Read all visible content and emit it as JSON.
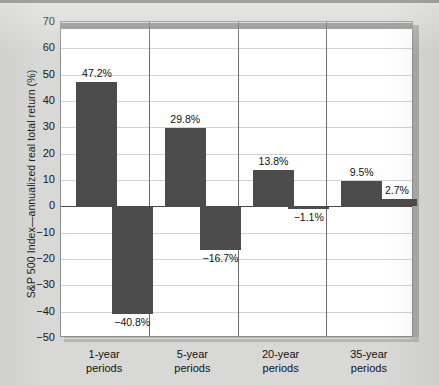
{
  "chart_data": {
    "type": "bar",
    "title": "",
    "xlabel": "",
    "ylabel": "S&P 500 Index—annualized real total return (%)",
    "ylim": [
      -50,
      70
    ],
    "ytick_values": [
      70,
      60,
      50,
      40,
      30,
      20,
      10,
      0,
      -10,
      -20,
      -30,
      -40,
      -50
    ],
    "ytick_labels": [
      "70",
      "60",
      "50",
      "40",
      "30",
      "20",
      "10",
      "0",
      "−10",
      "−20",
      "−30",
      "−40",
      "−50"
    ],
    "grid": true,
    "legend": "none",
    "categories": [
      "1-year periods",
      "5-year periods",
      "20-year periods",
      "35-year periods"
    ],
    "series": [
      {
        "name": "best",
        "values": [
          47.2,
          29.8,
          13.8,
          9.5
        ]
      },
      {
        "name": "worst",
        "values": [
          -40.8,
          -16.7,
          -1.1,
          2.7
        ]
      }
    ],
    "bars": [
      {
        "panel": 0,
        "slot": 0,
        "value": 47.2,
        "label": "47.2%"
      },
      {
        "panel": 0,
        "slot": 1,
        "value": -40.8,
        "label": "−40.8%"
      },
      {
        "panel": 1,
        "slot": 0,
        "value": 29.8,
        "label": "29.8%"
      },
      {
        "panel": 1,
        "slot": 1,
        "value": -16.7,
        "label": "−16.7%"
      },
      {
        "panel": 2,
        "slot": 0,
        "value": 13.8,
        "label": "13.8%"
      },
      {
        "panel": 2,
        "slot": 1,
        "value": -1.1,
        "label": "−1.1%"
      },
      {
        "panel": 3,
        "slot": 0,
        "value": 9.5,
        "label": "9.5%"
      },
      {
        "panel": 3,
        "slot": 1,
        "value": 2.7,
        "label": "2.7%"
      }
    ],
    "category_labels": [
      {
        "line1": "1-year",
        "line2": "periods"
      },
      {
        "line1": "5-year",
        "line2": "periods"
      },
      {
        "line1": "20-year",
        "line2": "periods"
      },
      {
        "line1": "35-year",
        "line2": "periods"
      }
    ],
    "colors": {
      "bar": "#4c4c4c",
      "plot_background": "#ffffff",
      "page_background": "#d8d8d6",
      "gridline": "#d3d3d1",
      "zero_line": "#4d4d4b",
      "panel_divider": "#6b6b69",
      "text": "#121212"
    }
  }
}
